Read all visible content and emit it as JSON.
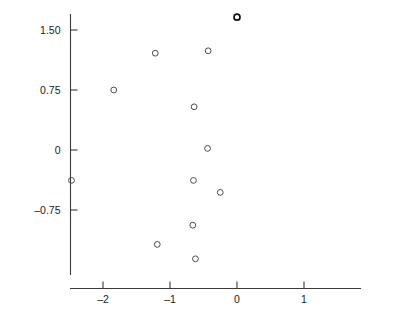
{
  "chart_data": {
    "type": "scatter",
    "title": "",
    "xlabel": "EPI",
    "ylabel": "OPI",
    "xlim": [
      -2.55,
      1.85
    ],
    "ylim": [
      -1.55,
      1.85
    ],
    "xticks": [
      -2,
      -1,
      0,
      1
    ],
    "xtick_labels": [
      "–2",
      "–1",
      "0",
      "1"
    ],
    "yticks": [
      1.5,
      0.75,
      0,
      -0.75
    ],
    "ytick_labels": [
      "1.50",
      "0.75",
      "0",
      "–0.75"
    ],
    "grid": false,
    "legend": false,
    "marker": "open-circle",
    "points": [
      {
        "x": -2.47,
        "y": -0.38,
        "label": "",
        "highlight": false
      },
      {
        "x": -1.84,
        "y": 0.75,
        "label": "",
        "highlight": false
      },
      {
        "x": -1.22,
        "y": 1.21,
        "label": "",
        "highlight": false
      },
      {
        "x": -1.19,
        "y": -1.18,
        "label": "",
        "highlight": false
      },
      {
        "x": -0.64,
        "y": 0.54,
        "label": "",
        "highlight": false
      },
      {
        "x": -0.65,
        "y": -0.38,
        "label": "",
        "highlight": false
      },
      {
        "x": -0.66,
        "y": -0.94,
        "label": "",
        "highlight": false
      },
      {
        "x": -0.62,
        "y": -1.36,
        "label": "",
        "highlight": false
      },
      {
        "x": -0.43,
        "y": 1.24,
        "label": "",
        "highlight": false
      },
      {
        "x": -0.44,
        "y": 0.02,
        "label": "",
        "highlight": false
      },
      {
        "x": -0.25,
        "y": -0.53,
        "label": "",
        "highlight": false
      },
      {
        "x": 0.0,
        "y": 1.66,
        "label": "Robitaille",
        "highlight": true
      },
      {
        "x": 0.02,
        "y": -0.09,
        "label": "",
        "highlight": false
      },
      {
        "x": 0.21,
        "y": 0.98,
        "label": "",
        "highlight": false
      },
      {
        "x": 0.3,
        "y": 0.92,
        "label": "",
        "highlight": false
      },
      {
        "x": 0.32,
        "y": 0.15,
        "label": "",
        "highlight": false
      },
      {
        "x": 0.58,
        "y": -1.36,
        "label": "",
        "highlight": false
      },
      {
        "x": 0.6,
        "y": -1.2,
        "label": "",
        "highlight": false
      },
      {
        "x": 0.61,
        "y": 1.18,
        "label": "",
        "highlight": false
      },
      {
        "x": 0.62,
        "y": 0.0,
        "label": "",
        "highlight": false
      },
      {
        "x": 0.71,
        "y": 0.79,
        "label": "",
        "highlight": false
      },
      {
        "x": 0.74,
        "y": -1.31,
        "label": "",
        "highlight": false
      },
      {
        "x": 0.85,
        "y": -0.74,
        "label": "",
        "highlight": false
      },
      {
        "x": 1.23,
        "y": -1.19,
        "label": "",
        "highlight": false
      },
      {
        "x": 1.39,
        "y": 1.24,
        "label": "Kurri",
        "highlight": true
      },
      {
        "x": 1.79,
        "y": 0.29,
        "label": "Gretzky",
        "highlight": true
      }
    ]
  },
  "colors": {
    "axis": "#3a3a3a",
    "marker": "#4a4a5a",
    "marker_highlight": "#111111",
    "text": "#1a1a1a",
    "background": "#ffffff"
  }
}
